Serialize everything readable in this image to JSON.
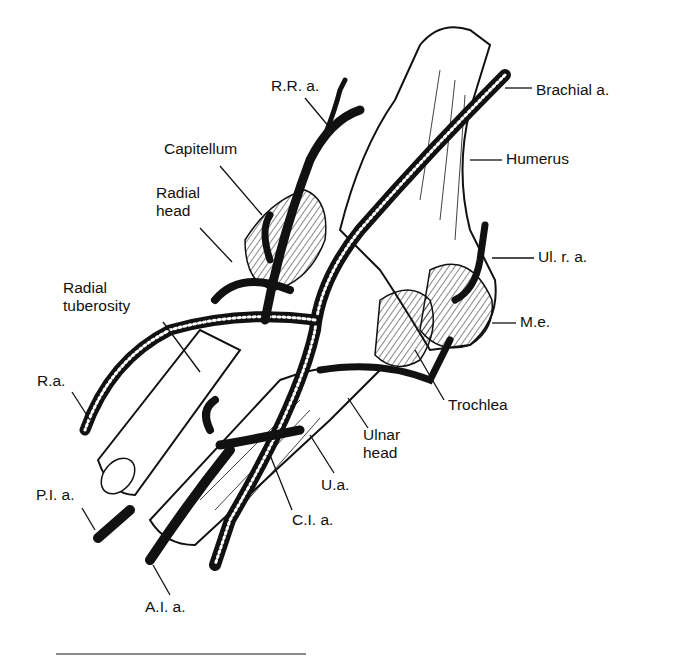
{
  "figure": {
    "labels": [
      {
        "id": "rr-a",
        "text": "R.R. a.",
        "x": 271,
        "y": 77
      },
      {
        "id": "brachial-a",
        "text": "Brachial a.",
        "x": 536,
        "y": 81
      },
      {
        "id": "capitellum",
        "text": "Capitellum",
        "x": 164,
        "y": 140
      },
      {
        "id": "humerus",
        "text": "Humerus",
        "x": 506,
        "y": 150
      },
      {
        "id": "radial-head",
        "text": "Radial\nhead",
        "x": 156,
        "y": 184
      },
      {
        "id": "ul-r-a",
        "text": "Ul. r. a.",
        "x": 538,
        "y": 248
      },
      {
        "id": "radial-tuberosity",
        "text": "Radial\ntuberosity",
        "x": 63,
        "y": 279
      },
      {
        "id": "m-e",
        "text": "M.e.",
        "x": 520,
        "y": 313
      },
      {
        "id": "r-a",
        "text": "R.a.",
        "x": 37,
        "y": 372
      },
      {
        "id": "trochlea",
        "text": "Trochlea",
        "x": 448,
        "y": 396
      },
      {
        "id": "ulnar-head",
        "text": "Ulnar\nhead",
        "x": 363,
        "y": 426
      },
      {
        "id": "u-a",
        "text": "U.a.",
        "x": 321,
        "y": 476
      },
      {
        "id": "p-i-a",
        "text": "P.I. a.",
        "x": 36,
        "y": 486
      },
      {
        "id": "c-i-a",
        "text": "C.I. a.",
        "x": 292,
        "y": 511
      },
      {
        "id": "a-i-a",
        "text": "A.I. a.",
        "x": 145,
        "y": 598
      }
    ]
  },
  "colors": {
    "ink": "#111111",
    "background": "#ffffff",
    "rule": "#8a8a8a"
  }
}
